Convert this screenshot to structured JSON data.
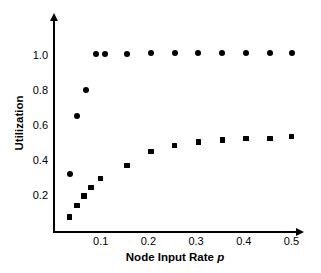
{
  "chart_data": {
    "type": "scatter",
    "title": "",
    "xlabel": "Node Input Rate p",
    "xlabel_plain": "Node Input Rate",
    "xlabel_italic": "p",
    "ylabel": "Utilization",
    "xlim": [
      0.0,
      0.51
    ],
    "ylim": [
      0.0,
      1.12
    ],
    "grid": false,
    "legend": "none",
    "xticks": [
      "0.1",
      "0.2",
      "0.3",
      "0.4",
      "0.5"
    ],
    "xtick_values": [
      0.1,
      0.2,
      0.3,
      0.4,
      0.5
    ],
    "yticks": [
      "0.2",
      "0.4",
      "0.6",
      "0.8",
      "1.0"
    ],
    "ytick_values": [
      0.2,
      0.4,
      0.6,
      0.8,
      1.0
    ],
    "series": [
      {
        "name": "circle-series",
        "marker": "circle",
        "color": "#000000",
        "points": [
          {
            "x": 0.035,
            "y": 0.325
          },
          {
            "x": 0.05,
            "y": 0.655
          },
          {
            "x": 0.07,
            "y": 0.805
          },
          {
            "x": 0.09,
            "y": 1.01
          },
          {
            "x": 0.11,
            "y": 1.01
          },
          {
            "x": 0.155,
            "y": 1.01
          },
          {
            "x": 0.205,
            "y": 1.015
          },
          {
            "x": 0.255,
            "y": 1.02
          },
          {
            "x": 0.305,
            "y": 1.02
          },
          {
            "x": 0.355,
            "y": 1.02
          },
          {
            "x": 0.405,
            "y": 1.02
          },
          {
            "x": 0.455,
            "y": 1.02
          },
          {
            "x": 0.5,
            "y": 1.02
          }
        ]
      },
      {
        "name": "square-series",
        "marker": "square",
        "color": "#000000",
        "points": [
          {
            "x": 0.035,
            "y": 0.08
          },
          {
            "x": 0.05,
            "y": 0.145
          },
          {
            "x": 0.065,
            "y": 0.2
          },
          {
            "x": 0.08,
            "y": 0.25
          },
          {
            "x": 0.1,
            "y": 0.3
          },
          {
            "x": 0.155,
            "y": 0.375
          },
          {
            "x": 0.205,
            "y": 0.455
          },
          {
            "x": 0.255,
            "y": 0.49
          },
          {
            "x": 0.305,
            "y": 0.51
          },
          {
            "x": 0.355,
            "y": 0.52
          },
          {
            "x": 0.405,
            "y": 0.53
          },
          {
            "x": 0.455,
            "y": 0.53
          },
          {
            "x": 0.5,
            "y": 0.54
          }
        ]
      }
    ],
    "axes_style": {
      "x_axis_arrow": true,
      "y_axis_arrow": true,
      "axis_color": "#000000",
      "background": "#ffffff"
    }
  }
}
